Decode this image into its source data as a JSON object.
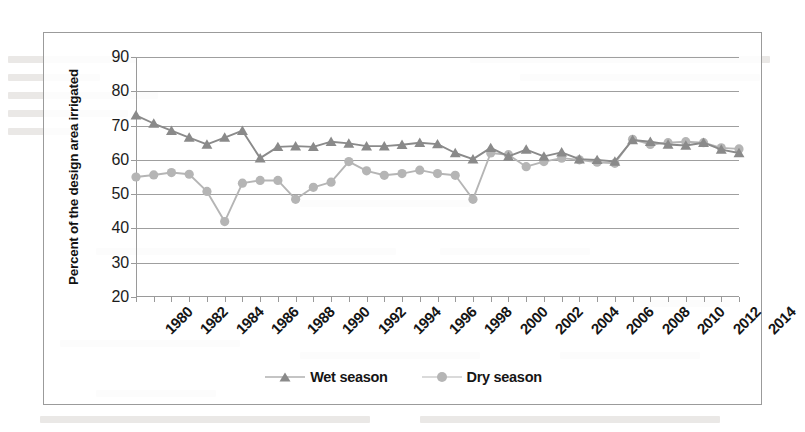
{
  "chart_data": {
    "type": "line",
    "title": "",
    "xlabel": "",
    "ylabel": "Percent of the design area irrigated",
    "ylim": [
      20,
      90
    ],
    "ytick_step": 10,
    "yticks": [
      90,
      80,
      70,
      60,
      50,
      40,
      30,
      20
    ],
    "xlim": [
      1980,
      2014
    ],
    "xticks_all_years": true,
    "xtick_labels": [
      "1980",
      "1982",
      "1984",
      "1986",
      "1988",
      "1990",
      "1992",
      "1994",
      "1996",
      "1998",
      "2000",
      "2002",
      "2004",
      "2006",
      "2008",
      "2010",
      "2012",
      "2014"
    ],
    "xtick_label_step": 2,
    "grid": "horizontal",
    "legend_position": "bottom-center",
    "x": [
      1980,
      1981,
      1982,
      1983,
      1984,
      1985,
      1986,
      1987,
      1988,
      1989,
      1990,
      1991,
      1992,
      1993,
      1994,
      1995,
      1996,
      1997,
      1998,
      1999,
      2000,
      2001,
      2002,
      2003,
      2004,
      2005,
      2006,
      2007,
      2008,
      2009,
      2010,
      2011,
      2012,
      2013,
      2014
    ],
    "series": [
      {
        "name": "Wet season",
        "color": "#8a8a8a",
        "marker": "triangle",
        "values": [
          73.0,
          70.6,
          68.5,
          66.5,
          64.5,
          66.5,
          68.5,
          60.5,
          63.8,
          64.0,
          63.8,
          65.3,
          64.8,
          64.0,
          64.0,
          64.4,
          65.0,
          64.6,
          62.0,
          60.2,
          63.5,
          61.0,
          63.0,
          61.0,
          62.2,
          60.2,
          60.0,
          59.5,
          65.8,
          65.3,
          64.5,
          64.2,
          65.0,
          63.0,
          62.0
        ]
      },
      {
        "name": "Dry season",
        "color": "#b5b5b5",
        "marker": "circle",
        "values": [
          55.0,
          55.6,
          56.3,
          55.8,
          50.8,
          42.0,
          53.2,
          54.0,
          54.0,
          48.5,
          52.0,
          53.5,
          59.5,
          56.8,
          55.5,
          56.0,
          57.0,
          56.0,
          55.5,
          48.5,
          62.0,
          61.5,
          58.0,
          59.5,
          60.5,
          60.0,
          59.3,
          59.0,
          66.0,
          64.5,
          65.0,
          65.3,
          65.0,
          63.5,
          63.2
        ]
      }
    ]
  },
  "legend": {
    "items": [
      {
        "label": "Wet season"
      },
      {
        "label": "Dry season"
      }
    ]
  },
  "axis": {
    "y_title": "Percent of the design area irrigated"
  },
  "colors": {
    "wet": "#8a8a8a",
    "dry": "#b5b5b5",
    "grid": "#9f9f9f",
    "axis": "#9a9a9a",
    "frame": "#9b9b9b",
    "text": "#151515"
  }
}
